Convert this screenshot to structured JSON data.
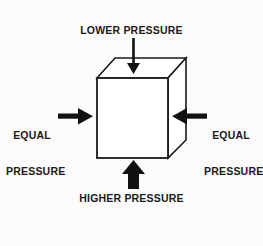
{
  "diagram": {
    "title_text": "Pressure on a cube",
    "background_color": "#fbfbfb",
    "stroke_color": "#1a1a1a",
    "face_color": "#ffffff",
    "labels": {
      "top": "LOWER PRESSURE",
      "bottom": "HIGHER PRESSURE",
      "left_line1": "EQUAL",
      "left_line2": "PRESSURE",
      "right_line1": "EQUAL",
      "right_line2": "PRESSURE"
    },
    "arrows": {
      "top": {
        "direction": "down",
        "weight": "thin",
        "meaning": "lower-pressure"
      },
      "bottom": {
        "direction": "up",
        "weight": "thick",
        "meaning": "higher-pressure"
      },
      "left": {
        "direction": "right",
        "weight": "medium",
        "meaning": "equal-pressure"
      },
      "right": {
        "direction": "left",
        "weight": "medium",
        "meaning": "equal-pressure"
      }
    },
    "cube": {
      "front_face": "97,78 168,78 168,158 97,158",
      "top_face": "97,78 115,58 186,58 168,78",
      "right_face": "168,78 186,58 186,140 168,158"
    }
  }
}
